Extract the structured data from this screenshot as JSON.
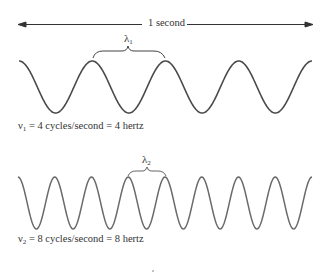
{
  "title_span": {
    "label": "1 second"
  },
  "wave1": {
    "wavelength_symbol": "λ",
    "wavelength_subscript": "1",
    "freq_symbol": "ν",
    "freq_subscript": "1",
    "caption_rest": " = 4 cycles/second = 4 hertz",
    "cycles": 4,
    "color": "#4a4a4a"
  },
  "wave2": {
    "wavelength_symbol": "λ",
    "wavelength_subscript": "2",
    "freq_symbol": "ν",
    "freq_subscript": "2",
    "caption_rest": " = 8 cycles/second = 8 hertz",
    "cycles": 8,
    "color": "#6a6a6a"
  }
}
